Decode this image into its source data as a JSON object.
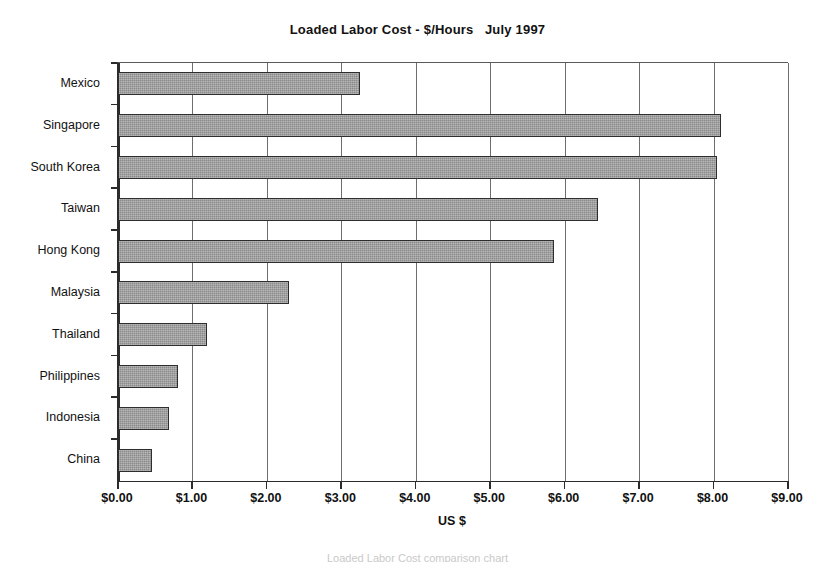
{
  "chart_data": {
    "type": "bar",
    "orientation": "horizontal",
    "title": "Loaded Labor Cost - $/Hours   July 1997",
    "xlabel": "US $",
    "ylabel": "",
    "categories": [
      "Mexico",
      "Singapore",
      "South Korea",
      "Taiwan",
      "Hong Kong",
      "Malaysia",
      "Thailand",
      "Philippines",
      "Indonesia",
      "China"
    ],
    "values": [
      3.25,
      8.1,
      8.05,
      6.45,
      5.85,
      2.3,
      1.2,
      0.8,
      0.68,
      0.45
    ],
    "xlim": [
      0,
      9
    ],
    "xtick_values": [
      0,
      1,
      2,
      3,
      4,
      5,
      6,
      7,
      8,
      9
    ],
    "xtick_labels": [
      "$0.00",
      "$1.00",
      "$2.00",
      "$3.00",
      "$4.00",
      "$5.00",
      "$6.00",
      "$7.00",
      "$8.00",
      "$9.00"
    ],
    "grid": "vertical",
    "legend": "none",
    "bar_fill_color": "#8a8a8a",
    "bar_border_color": "#2e2e2e",
    "axis_color": "#2b2b2b",
    "gridline_color": "#6e6e6e",
    "background_color": "#ffffff"
  },
  "footer": {
    "note": "Loaded Labor Cost comparison chart"
  }
}
